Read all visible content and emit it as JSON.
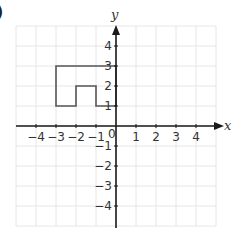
{
  "figure": {
    "part_label": ")",
    "x_axis_label": "x",
    "y_axis_label": "y",
    "origin_label": "0",
    "x_tick_labels": [
      "−4",
      "−3",
      "−2",
      "−1",
      "1",
      "2",
      "3",
      "4"
    ],
    "x_tick_values": [
      -4,
      -3,
      -2,
      -1,
      1,
      2,
      3,
      4
    ],
    "y_tick_labels": [
      "4",
      "3",
      "2",
      "1",
      "−1",
      "−2",
      "−3",
      "−4"
    ],
    "y_tick_values": [
      4,
      3,
      2,
      1,
      -1,
      -2,
      -3,
      -4
    ],
    "grid": {
      "xmin": -5,
      "xmax": 5,
      "ymin": -5,
      "ymax": 5,
      "step": 1
    },
    "shape": {
      "name": "polygon",
      "vertices": [
        [
          -3,
          1
        ],
        [
          -3,
          3
        ],
        [
          0,
          3
        ],
        [
          0,
          1
        ],
        [
          -1,
          1
        ],
        [
          -1,
          2
        ],
        [
          -2,
          2
        ],
        [
          -2,
          1
        ]
      ],
      "stroke": "#555555"
    },
    "colors": {
      "grid": "#e6e6e6",
      "axis": "#1a1a1a",
      "text": "#333333"
    }
  }
}
